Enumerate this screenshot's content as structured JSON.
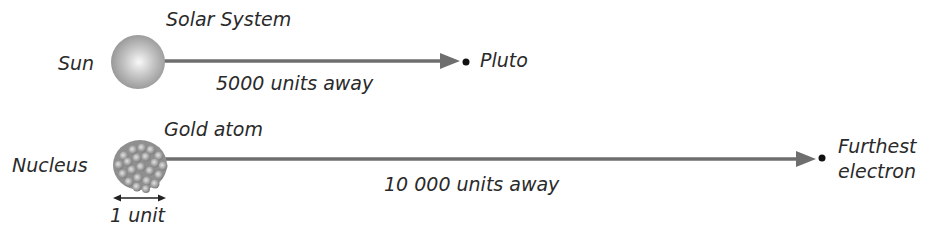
{
  "solar_system": {
    "title": "Solar System",
    "center_label": "Sun",
    "end_label": "Pluto",
    "distance_label": "5000 units away"
  },
  "gold_atom": {
    "title": "Gold atom",
    "center_label": "Nucleus",
    "end_label_line1": "Furthest",
    "end_label_line2": "electron",
    "distance_label": "10 000 units away",
    "scale_label": "1 unit"
  },
  "colors": {
    "arrow": "#6e6e6e",
    "text": "#2a2a2a",
    "dot": "#111111",
    "sun_light": "#f4f4f4",
    "sun_dark": "#8c8c8c",
    "nucleus_base": "#9a9a9a"
  }
}
